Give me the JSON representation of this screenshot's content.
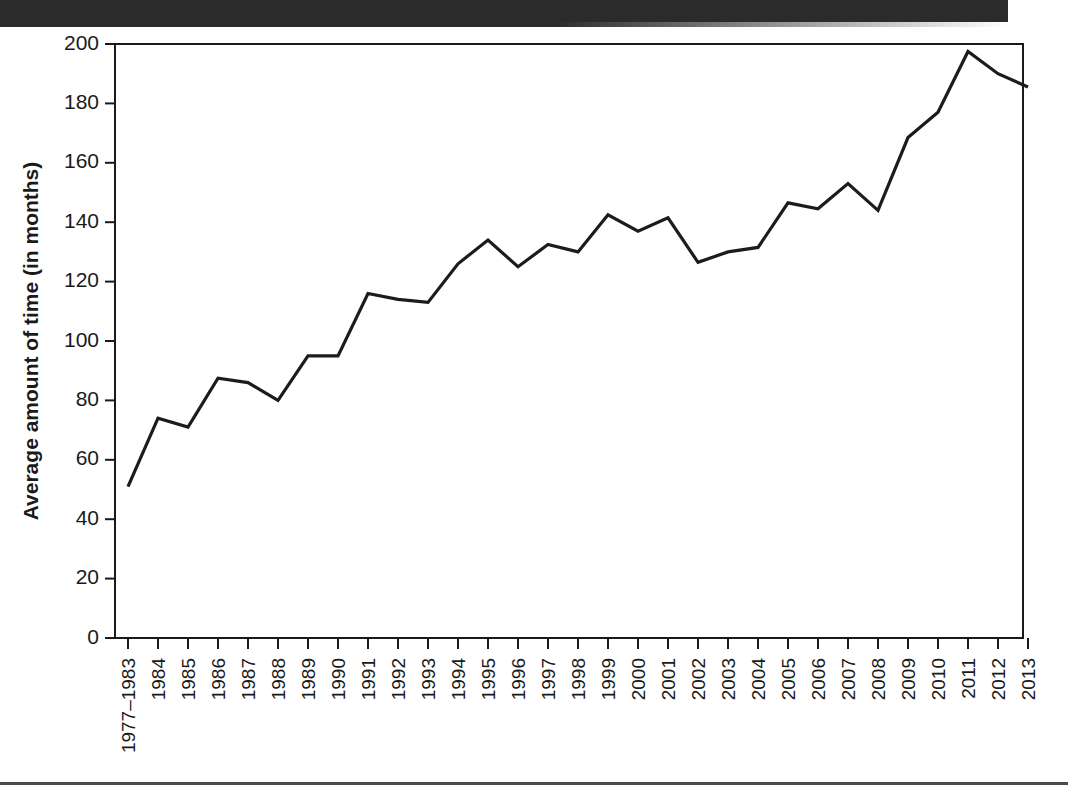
{
  "figure": {
    "header_band_color": "#2b2b2b",
    "background_color": "#ffffff",
    "line_color": "#1c1c1c"
  },
  "chart_data": {
    "type": "line",
    "title": "",
    "subtitle": "",
    "xlabel": "",
    "ylabel": "Average amount of time (in months)",
    "ylim": [
      0,
      200
    ],
    "yticks": [
      0,
      20,
      40,
      60,
      80,
      100,
      120,
      140,
      160,
      180,
      200
    ],
    "ytick_labels": [
      "0",
      "20",
      "40",
      "60",
      "80",
      "100",
      "120",
      "140",
      "160",
      "180",
      "200"
    ],
    "grid": false,
    "legend": false,
    "legend_position": "none",
    "categories": [
      "1977–1983",
      "1984",
      "1985",
      "1986",
      "1987",
      "1988",
      "1989",
      "1990",
      "1991",
      "1992",
      "1993",
      "1994",
      "1995",
      "1996",
      "1997",
      "1998",
      "1999",
      "2000",
      "2001",
      "2002",
      "2003",
      "2004",
      "2005",
      "2006",
      "2007",
      "2008",
      "2009",
      "2010",
      "2011",
      "2012",
      "2013"
    ],
    "values": [
      51,
      74,
      71,
      87.5,
      86,
      80,
      95,
      95,
      116,
      114,
      113,
      126,
      134,
      125,
      132.5,
      130,
      142.5,
      137,
      141.5,
      126.5,
      130,
      131.5,
      146.5,
      144.5,
      153,
      144,
      168.5,
      177,
      197.5,
      190,
      185.5
    ],
    "series": [
      {
        "name": "Average amount of time (in months)",
        "values": [
          51,
          74,
          71,
          87.5,
          86,
          80,
          95,
          95,
          116,
          114,
          113,
          126,
          134,
          125,
          132.5,
          130,
          142.5,
          137,
          141.5,
          126.5,
          130,
          131.5,
          146.5,
          144.5,
          153,
          144,
          168.5,
          177,
          197.5,
          190,
          185.5
        ]
      }
    ]
  }
}
